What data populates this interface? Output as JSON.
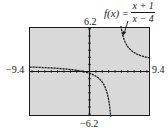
{
  "chart_data": {
    "type": "line",
    "function": {
      "name": "f(x)",
      "numerator": "x + 1",
      "denominator": "x − 4"
    },
    "xlabel": "",
    "ylabel": "",
    "xlim": [
      -9.4,
      9.4
    ],
    "ylim": [
      -6.2,
      6.2
    ],
    "window_labels": {
      "xmin": "−9.4",
      "xmax": "9.4",
      "ymin": "−6.2",
      "ymax": "6.2"
    },
    "vertical_asymptote": 4,
    "horizontal_asymptote": 1,
    "grid": false,
    "legend": null,
    "annotation": "arrow from function label pointing to right branch",
    "series": [
      {
        "name": "left branch",
        "x": [
          -9.4,
          -8,
          -6,
          -4,
          -2,
          0,
          1,
          2,
          3,
          3.5,
          3.8
        ],
        "y": [
          0.63,
          0.58,
          0.5,
          0.38,
          0.17,
          -0.25,
          -0.67,
          -1.5,
          -4,
          -9,
          -24
        ]
      },
      {
        "name": "right branch",
        "x": [
          5,
          5.5,
          6,
          7,
          8,
          9,
          9.4
        ],
        "y": [
          6,
          4.33,
          3.5,
          2.67,
          2.25,
          2,
          1.93
        ]
      }
    ],
    "colors": {
      "plot_bg": "#d9d9d9",
      "curve": "#1a1a1a",
      "frame": "#1a1a1a"
    }
  }
}
